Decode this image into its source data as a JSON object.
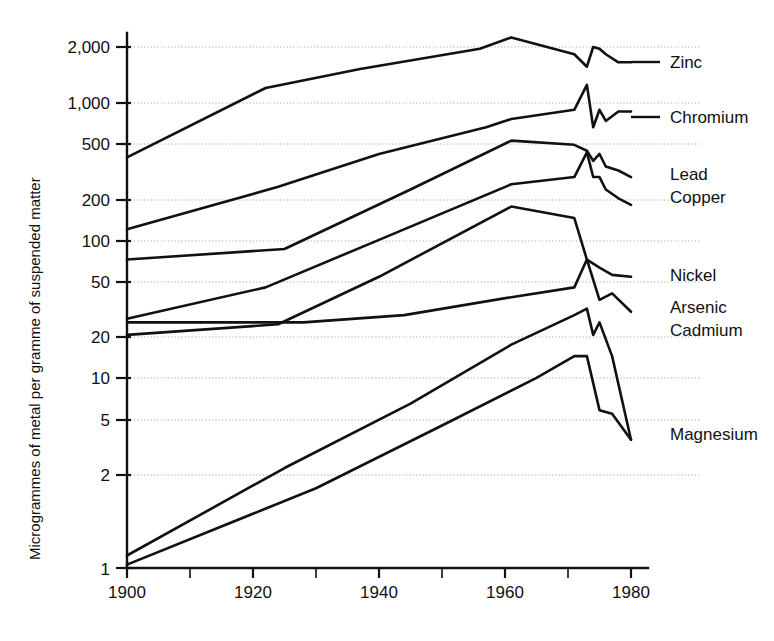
{
  "chart_data": {
    "type": "line",
    "title": "",
    "subtitle": "",
    "xlabel": "",
    "ylabel": "Microgrammes of metal per gramme of suspended matter",
    "xlim": [
      1900,
      1982
    ],
    "ylim": [
      1,
      2600
    ],
    "yscale": "log",
    "grid": true,
    "legend_position": "right-inline-labels",
    "x_ticks": [
      1900,
      1910,
      1920,
      1930,
      1940,
      1950,
      1960,
      1970,
      1980
    ],
    "x_tick_labels": [
      "1900",
      "",
      "1920",
      "",
      "1940",
      "",
      "1960",
      "",
      "1980"
    ],
    "y_ticks": [
      1,
      2,
      5,
      10,
      20,
      50,
      100,
      200,
      500,
      1000,
      2000
    ],
    "y_tick_labels": [
      "1",
      "2",
      "5",
      "10",
      "20",
      "50",
      "100",
      "200",
      "500",
      "1,000",
      "2,000"
    ],
    "series": [
      {
        "name": "Zinc",
        "x": [
          1900,
          1922,
          1937,
          1956,
          1961,
          1971,
          1973,
          1974,
          1975,
          1976,
          1978,
          1980
        ],
        "values": [
          400,
          1100,
          1450,
          1950,
          2300,
          1800,
          1500,
          2000,
          1950,
          1800,
          1600,
          1600
        ]
      },
      {
        "name": "Chromium",
        "x": [
          1900,
          1924,
          1940,
          1957,
          1961,
          1971,
          1973,
          1974,
          1975,
          1976,
          1978,
          1980
        ],
        "values": [
          140,
          260,
          420,
          620,
          700,
          800,
          1150,
          620,
          800,
          680,
          780,
          780
        ]
      },
      {
        "name": "Lead",
        "x": [
          1900,
          1925,
          1945,
          1961,
          1971,
          1973,
          1974,
          1975,
          1976,
          1978,
          1980
        ],
        "values": [
          90,
          105,
          250,
          510,
          480,
          440,
          380,
          420,
          350,
          330,
          300
        ]
      },
      {
        "name": "Copper",
        "x": [
          1900,
          1922,
          1940,
          1961,
          1971,
          1973,
          1974,
          1975,
          1976,
          1978,
          1980
        ],
        "values": [
          38,
          60,
          120,
          270,
          300,
          430,
          300,
          300,
          250,
          220,
          200
        ]
      },
      {
        "name": "Nickel",
        "x": [
          1900,
          1924,
          1940,
          1961,
          1971,
          1973,
          1975,
          1977,
          1980
        ],
        "values": [
          30,
          35,
          70,
          195,
          165,
          90,
          80,
          72,
          70
        ]
      },
      {
        "name": "Arsenic",
        "x": [
          1900,
          1928,
          1944,
          1961,
          1971,
          1973,
          1975,
          1977,
          1980
        ],
        "values": [
          36,
          36,
          40,
          52,
          60,
          90,
          50,
          55,
          42
        ]
      },
      {
        "name": "Cadmium",
        "x": [
          1900,
          1925,
          1945,
          1961,
          1971,
          1973,
          1974,
          1975,
          1977,
          1980
        ],
        "values": [
          1.2,
          4.3,
          11,
          26,
          40,
          44,
          30,
          36,
          22,
          6.5
        ]
      },
      {
        "name": "Magnesium",
        "x": [
          1900,
          1930,
          1950,
          1965,
          1971,
          1973,
          1975,
          1977,
          1980
        ],
        "values": [
          1.05,
          3.2,
          8.0,
          16,
          22,
          22,
          10,
          9.5,
          6.5
        ]
      }
    ],
    "series_labels": [
      {
        "name": "Zinc",
        "label": "Zinc"
      },
      {
        "name": "Chromium",
        "label": "Chromium"
      },
      {
        "name": "Lead",
        "label": "Lead"
      },
      {
        "name": "Copper",
        "label": "Copper"
      },
      {
        "name": "Nickel",
        "label": "Nickel"
      },
      {
        "name": "Arsenic",
        "label": "Arsenic"
      },
      {
        "name": "Cadmium",
        "label": "Cadmium"
      },
      {
        "name": "Magnesium",
        "label": "Magnesium"
      }
    ]
  },
  "labels": {
    "zinc": "Zinc",
    "chromium": "Chromium",
    "lead": "Lead",
    "copper": "Copper",
    "nickel": "Nickel",
    "arsenic": "Arsenic",
    "cadmium": "Cadmium",
    "magnesium": "Magnesium"
  },
  "axis": {
    "ylabel": "Microgrammes of metal per gramme of suspended matter",
    "y_tick_labels": {
      "t2000": "2,000",
      "t1000": "1,000",
      "t500": "500",
      "t200": "200",
      "t100": "100",
      "t50": "50",
      "t20": "20",
      "t10": "10",
      "t5": "5",
      "t2": "2",
      "t1": "1"
    },
    "x_tick_labels": {
      "x1900": "1900",
      "x1920": "1920",
      "x1940": "1940",
      "x1960": "1960",
      "x1980": "1980"
    }
  },
  "colors": {
    "line": "#111111",
    "grid": "#9a9a9a",
    "background": "#ffffff"
  }
}
